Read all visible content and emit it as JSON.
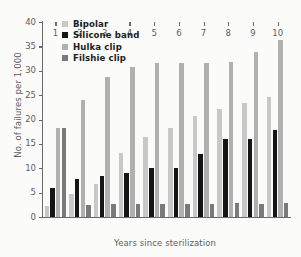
{
  "chart_data": {
    "type": "bar",
    "title": "",
    "xlabel": "Years since sterilization",
    "ylabel": "No. of failures per 1,000",
    "categories": [
      "1",
      "2",
      "3",
      "4",
      "5",
      "6",
      "7",
      "8",
      "9",
      "10"
    ],
    "ylim": [
      0,
      40
    ],
    "yticks": [
      0,
      5,
      10,
      15,
      20,
      25,
      30,
      35,
      40
    ],
    "grid": false,
    "legend_position": "top-left",
    "series": [
      {
        "name": "Bipolar",
        "color": "#c8c8c8",
        "values": [
          2.2,
          4.8,
          6.7,
          13.2,
          16.5,
          18.3,
          20.8,
          22.1,
          23.4,
          24.6
        ]
      },
      {
        "name": "Silicone band",
        "color": "#151515",
        "values": [
          6.0,
          7.7,
          8.4,
          9.0,
          10.0,
          10.1,
          13.0,
          16.1,
          16.0,
          17.8
        ]
      },
      {
        "name": "Hulka clip",
        "color": "#b0b0b0",
        "values": [
          18.2,
          24.0,
          28.8,
          30.7,
          31.5,
          31.5,
          31.6,
          31.7,
          33.8,
          36.3
        ]
      },
      {
        "name": "Filshie clip",
        "color": "#7a7a7a",
        "values": [
          18.3,
          2.5,
          2.7,
          2.7,
          2.6,
          2.6,
          2.7,
          2.8,
          2.7,
          2.8
        ]
      }
    ]
  }
}
